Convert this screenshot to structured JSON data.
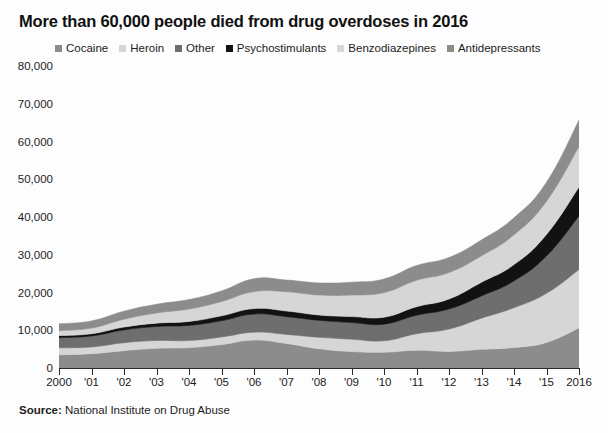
{
  "title": "More than 60,000 people died from drug overdoses in 2016",
  "source": {
    "label": "Source:",
    "text": " National Institute on Drug Abuse"
  },
  "legend": [
    {
      "label": "Cocaine",
      "color": "#8c8c8c"
    },
    {
      "label": "Heroin",
      "color": "#d6d6d6"
    },
    {
      "label": "Other",
      "color": "#6e6e6e"
    },
    {
      "label": "Psychostimulants",
      "color": "#121212"
    },
    {
      "label": "Benzodiazepines",
      "color": "#d6d6d6"
    },
    {
      "label": "Antidepressants",
      "color": "#8c8c8c"
    }
  ],
  "chart_data": {
    "type": "area",
    "stacked": true,
    "title": "More than 60,000 people died from drug overdoses in 2016",
    "xlabel": "",
    "ylabel": "",
    "ylim": [
      0,
      80000
    ],
    "ytick_values": [
      0,
      10000,
      20000,
      30000,
      40000,
      50000,
      60000,
      70000,
      80000
    ],
    "ytick_labels": [
      "0",
      "10,000",
      "20,000",
      "30,000",
      "40,000",
      "50,000",
      "60,000",
      "70,000",
      "80,000"
    ],
    "grid": false,
    "legend_position": "top",
    "categories": [
      2000,
      2001,
      2002,
      2003,
      2004,
      2005,
      2006,
      2007,
      2008,
      2009,
      2010,
      2011,
      2012,
      2013,
      2014,
      2015,
      2016
    ],
    "xtick_labels": [
      "2000",
      "'01",
      "'02",
      "'03",
      "'04",
      "'05",
      "'06",
      "'07",
      "'08",
      "'09",
      "'10",
      "'11",
      "'12",
      "'13",
      "'14",
      "'15",
      "2016"
    ],
    "series": [
      {
        "name": "Cocaine",
        "color": "#8c8c8c",
        "values": [
          3500,
          3800,
          4600,
          5200,
          5400,
          6200,
          7400,
          6500,
          5100,
          4350,
          4180,
          4680,
          4400,
          4940,
          5420,
          6780,
          10620
        ]
      },
      {
        "name": "Heroin",
        "color": "#d6d6d6",
        "values": [
          1840,
          1780,
          2090,
          2080,
          1880,
          2010,
          2090,
          2400,
          3040,
          3280,
          3040,
          4400,
          5930,
          8260,
          10570,
          12990,
          15470
        ]
      },
      {
        "name": "Other",
        "color": "#6e6e6e",
        "values": [
          2700,
          2900,
          3400,
          3700,
          4000,
          4300,
          4800,
          4700,
          4500,
          4400,
          4400,
          4900,
          5300,
          5900,
          7100,
          9900,
          14200
        ]
      },
      {
        "name": "Psychostimulants",
        "color": "#121212",
        "values": [
          550,
          600,
          750,
          900,
          1050,
          1300,
          1450,
          1500,
          1400,
          1600,
          1850,
          2250,
          2650,
          3630,
          4300,
          5720,
          7660
        ]
      },
      {
        "name": "Benzodiazepines",
        "color": "#d6d6d6",
        "values": [
          1300,
          1500,
          2100,
          2700,
          3300,
          3800,
          4500,
          5100,
          5300,
          5700,
          6500,
          7000,
          7000,
          7000,
          7900,
          8800,
          10700
        ]
      },
      {
        "name": "Antidepressants",
        "color": "#8c8c8c",
        "values": [
          1800,
          1900,
          2100,
          2300,
          2500,
          2800,
          3400,
          3100,
          3200,
          3400,
          3600,
          3900,
          4000,
          4200,
          4500,
          5000,
          7000
        ]
      }
    ],
    "totals": [
      11690,
      12480,
      15040,
      16880,
      18130,
      20410,
      23640,
      23300,
      22540,
      22730,
      23570,
      27130,
      29280,
      33930,
      39790,
      49190,
      65650
    ]
  }
}
